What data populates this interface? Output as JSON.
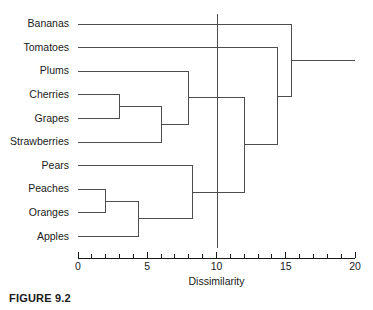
{
  "figure": {
    "caption": "FIGURE 9.2"
  },
  "chart_data": {
    "type": "dendrogram",
    "title": "",
    "xlabel": "Dissimilarity",
    "ylabel": "",
    "xlim": [
      0,
      20
    ],
    "xticks": [
      0,
      5,
      10,
      15,
      20
    ],
    "xtick_labels": [
      "0",
      "5",
      "10",
      "15",
      "20"
    ],
    "minor_tick_step": 1,
    "grid": false,
    "orientation": "horizontal-left-to-right",
    "leaves": [
      "Bananas",
      "Tomatoes",
      "Plums",
      "Cherries",
      "Grapes",
      "Strawberries",
      "Pears",
      "Peaches",
      "Oranges",
      "Apples"
    ],
    "merges": [
      {
        "id": "m1",
        "label": "Peaches + Oranges",
        "children": [
          "Peaches",
          "Oranges"
        ],
        "height": 2.0
      },
      {
        "id": "m2",
        "label": "Cherries + Grapes",
        "children": [
          "Cherries",
          "Grapes"
        ],
        "height": 3.0
      },
      {
        "id": "m3",
        "label": "(Peaches, Oranges) + Apples",
        "children": [
          "m1",
          "Apples"
        ],
        "height": 4.4
      },
      {
        "id": "m4",
        "label": "(Cherries, Grapes) + Strawberries",
        "children": [
          "m2",
          "Strawberries"
        ],
        "height": 6.0
      },
      {
        "id": "m5",
        "label": "(Cherries, Grapes, Strawberries) + Plums",
        "children": [
          "m4",
          "Plums"
        ],
        "height": 8.0
      },
      {
        "id": "m6",
        "label": "(Peaches, Oranges, Apples) + Pears",
        "children": [
          "m3",
          "Pears"
        ],
        "height": 8.3
      },
      {
        "id": "m7",
        "label": "Plum cluster + Pear cluster",
        "children": [
          "m5",
          "m6"
        ],
        "height": 12.0
      },
      {
        "id": "m8",
        "label": "Fruit cluster + Tomatoes",
        "children": [
          "m7",
          "Tomatoes"
        ],
        "height": 14.4
      },
      {
        "id": "m9",
        "label": "All + Bananas",
        "children": [
          "m8",
          "Bananas"
        ],
        "height": 15.4
      }
    ],
    "root_extent": 20.0,
    "cut_line": {
      "value": 10.1,
      "label": "",
      "orientation": "vertical"
    },
    "colors": {
      "link": "#4d4d4d",
      "axis": "#1a1a1a",
      "cut_line": "#4d4d4d",
      "text": "#1a1a1a",
      "background": "#ffffff"
    }
  }
}
